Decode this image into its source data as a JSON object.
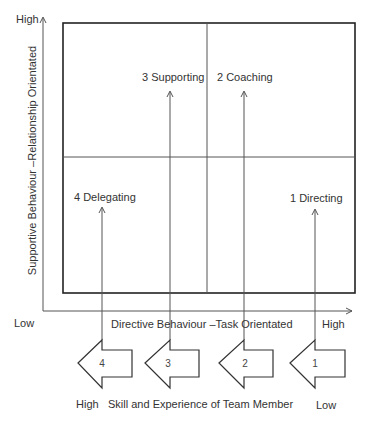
{
  "diagram": {
    "y_axis": {
      "label": "Supportive Behaviour –Relationship Orientated",
      "high_label": "High"
    },
    "x_axis": {
      "label": "Directive Behaviour –Task Orientated",
      "low_label": "Low",
      "high_label": "High"
    },
    "quadrants": [
      {
        "id": "supporting",
        "label": "3 Supporting"
      },
      {
        "id": "coaching",
        "label": "2 Coaching"
      },
      {
        "id": "delegating",
        "label": "4 Delegating"
      },
      {
        "id": "directing",
        "label": "1 Directing"
      }
    ],
    "development_arrows": [
      {
        "number": "4"
      },
      {
        "number": "3"
      },
      {
        "number": "2"
      },
      {
        "number": "1"
      }
    ],
    "bottom_scale": {
      "high_label": "High",
      "label": "Skill and Experience of Team Member",
      "low_label": "Low"
    },
    "colors": {
      "line": "#333333",
      "box": "#222222",
      "thin_line": "#555555"
    }
  }
}
